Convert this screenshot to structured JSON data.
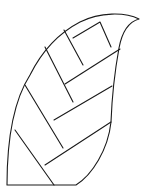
{
  "figure": {
    "stroke_color": "#1a1a1a",
    "background": "#ffffff",
    "outline_path": "M7,185 C7,140 14,100 30,75 C40,55 55,35 80,22 C100,12 125,12 139,19 C128,22 122,32 119,48 C115,70 112,95 111,122 C108,150 92,175 76,185 L7,185",
    "veins": [
      {
        "id": "vein-1",
        "x1": 15,
        "y1": 130,
        "x2": 54,
        "y2": 185
      },
      {
        "id": "vein-2",
        "x1": 25,
        "y1": 85,
        "x2": 63,
        "y2": 148
      },
      {
        "id": "vein-3",
        "x1": 45,
        "y1": 47,
        "x2": 73,
        "y2": 102
      },
      {
        "id": "vein-4",
        "x1": 64,
        "y1": 30,
        "x2": 83,
        "y2": 65
      },
      {
        "id": "vein-5",
        "x1": 65,
        "y1": 84,
        "x2": 120,
        "y2": 49
      },
      {
        "id": "vein-6",
        "x1": 54,
        "y1": 120,
        "x2": 112,
        "y2": 86
      },
      {
        "id": "vein-7",
        "x1": 45,
        "y1": 165,
        "x2": 111,
        "y2": 122
      }
    ],
    "hook_path": "M73,38 L100,22 L111,47"
  }
}
